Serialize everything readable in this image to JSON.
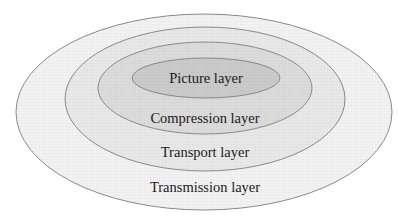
{
  "diagram": {
    "type": "nested-ellipses",
    "layers": [
      {
        "id": "transmission",
        "label": "Transmission layer",
        "fill": "#f3f3f3"
      },
      {
        "id": "transport",
        "label": "Transport layer",
        "fill": "#e9e9e9"
      },
      {
        "id": "compression",
        "label": "Compression layer",
        "fill": "#dcdcdc"
      },
      {
        "id": "picture",
        "label": "Picture layer",
        "fill": "#cbcbcb"
      }
    ],
    "outline_color": "#8a8a8a"
  }
}
